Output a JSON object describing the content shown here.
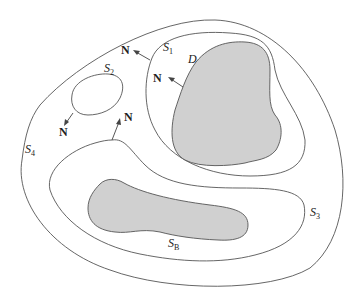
{
  "diagram": {
    "type": "region-surfaces",
    "colors": {
      "line": "#555555",
      "shaded": "#d0d0d0",
      "background": "#ffffff"
    },
    "surfaces": [
      {
        "id": "S1",
        "symbol": "S",
        "subscript": "1",
        "description": "closed surface enclosing shaded body D"
      },
      {
        "id": "S2",
        "symbol": "S",
        "subscript": "2",
        "description": "small closed surface with outward normal"
      },
      {
        "id": "S3",
        "symbol": "S",
        "subscript": "3",
        "description": "closed surface enclosing shaded body S_B"
      },
      {
        "id": "S4",
        "symbol": "S",
        "subscript": "4",
        "description": "outer closed surface enclosing all others"
      },
      {
        "id": "SB",
        "symbol": "S",
        "subscript": "B",
        "description": "boundary of shaded body"
      }
    ],
    "regions": [
      {
        "id": "D",
        "label": "D",
        "shaded": true
      }
    ],
    "normals": [
      {
        "label": "N",
        "on": "S1-outer"
      },
      {
        "label": "N",
        "on": "D"
      },
      {
        "label": "N",
        "on": "S2"
      },
      {
        "label": "N",
        "on": "S3"
      }
    ]
  },
  "labels": {
    "s1_main": "S",
    "s1_sub": "1",
    "s2_main": "S",
    "s2_sub": "2",
    "s3_main": "S",
    "s3_sub": "3",
    "s4_main": "S",
    "s4_sub": "4",
    "sb_main": "S",
    "sb_sub": "B",
    "d": "D",
    "n1": "N",
    "n2": "N",
    "n3": "N",
    "n4": "N"
  }
}
